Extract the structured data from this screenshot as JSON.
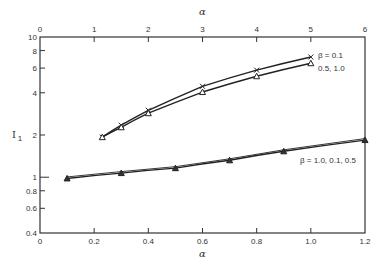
{
  "chart_data": {
    "type": "line",
    "title": "",
    "xlabel": "α",
    "x2label": "α",
    "ylabel": "I1",
    "xlim": [
      0,
      1.2
    ],
    "x2lim": [
      0,
      6
    ],
    "ylim": [
      0.4,
      10
    ],
    "yscale": "log",
    "grid": false,
    "x_ticks": [
      "0",
      "0.2",
      "0.4",
      "0.6",
      "0.8",
      "1.0",
      "1.2"
    ],
    "x2_ticks": [
      "0",
      "1",
      "2",
      "3",
      "4",
      "5",
      "6"
    ],
    "y_ticks": [
      "0.4",
      "0.6",
      "0.8",
      "1",
      "2",
      "4",
      "6",
      "8",
      "10"
    ],
    "series": [
      {
        "name": "β = 0.1",
        "axis": "top",
        "marker": "x",
        "x": [
          1.15,
          1.5,
          2,
          3,
          4,
          5
        ],
        "values": [
          1.93,
          2.35,
          3.0,
          4.45,
          5.8,
          7.2
        ]
      },
      {
        "name": "0.5, 1.0",
        "axis": "top",
        "marker": "triangle",
        "x": [
          1.15,
          1.5,
          2,
          3,
          4,
          5
        ],
        "values": [
          1.93,
          2.27,
          2.86,
          4.05,
          5.25,
          6.5
        ]
      },
      {
        "name": "β = 1.0, 0.1, 0.5",
        "axis": "bottom",
        "marker": "triangle",
        "x": [
          0.1,
          0.3,
          0.5,
          0.7,
          0.9,
          1.2
        ],
        "values": [
          0.98,
          1.07,
          1.16,
          1.32,
          1.53,
          1.84
        ]
      }
    ]
  },
  "labels": {
    "x_title": "α",
    "x2_title": "α",
    "y_title": "I",
    "y_sub": "1",
    "series_a": "β = 0.1",
    "series_b": "0.5, 1.0",
    "series_c": "β = 1.0, 0.1, 0.5"
  }
}
